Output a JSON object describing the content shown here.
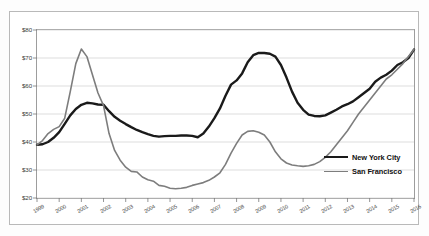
{
  "chart_data": {
    "type": "line",
    "title": "",
    "xlabel": "",
    "ylabel": "",
    "xlim": [
      1999,
      2016
    ],
    "ylim": [
      20,
      80
    ],
    "grid": true,
    "legend_position": "right-inside",
    "y_ticks": [
      "$20",
      "$30",
      "$40",
      "$50",
      "$60",
      "$70",
      "$80"
    ],
    "y_tick_values": [
      20,
      30,
      40,
      50,
      60,
      70,
      80
    ],
    "x_ticks": [
      "1999",
      "2000",
      "2001",
      "2002",
      "2003",
      "2004",
      "2005",
      "2006",
      "2007",
      "2008",
      "2009",
      "2010",
      "2011",
      "2012",
      "2013",
      "2014",
      "2015",
      "2016"
    ],
    "x_tick_values": [
      1999,
      2000,
      2001,
      2002,
      2003,
      2004,
      2005,
      2006,
      2007,
      2008,
      2009,
      2010,
      2011,
      2012,
      2013,
      2014,
      2015,
      2016
    ],
    "series": [
      {
        "name": "New York City",
        "color": "#1a1a1a",
        "width": 2.4,
        "x": [
          1999,
          1999.25,
          1999.5,
          1999.75,
          2000,
          2000.25,
          2000.5,
          2000.75,
          2001,
          2001.25,
          2001.5,
          2001.75,
          2002,
          2002.25,
          2002.5,
          2002.75,
          2003,
          2003.25,
          2003.5,
          2003.75,
          2004,
          2004.25,
          2004.5,
          2004.75,
          2005,
          2005.25,
          2005.5,
          2005.75,
          2006,
          2006.25,
          2006.5,
          2006.75,
          2007,
          2007.25,
          2007.5,
          2007.75,
          2008,
          2008.25,
          2008.5,
          2008.75,
          2009,
          2009.25,
          2009.5,
          2009.75,
          2010,
          2010.25,
          2010.5,
          2010.75,
          2011,
          2011.25,
          2011.5,
          2011.75,
          2012,
          2012.25,
          2012.5,
          2012.75,
          2013,
          2013.25,
          2013.5,
          2013.75,
          2014,
          2014.25,
          2014.5,
          2014.75,
          2015,
          2015.25,
          2015.5,
          2015.75,
          2016
        ],
        "values": [
          39.0,
          39.2,
          40.0,
          41.5,
          43.5,
          46.5,
          49.5,
          51.8,
          53.3,
          54.0,
          53.8,
          53.4,
          53.3,
          51.0,
          49.0,
          47.6,
          46.4,
          45.3,
          44.3,
          43.5,
          42.8,
          42.2,
          41.9,
          42.1,
          42.2,
          42.2,
          42.3,
          42.3,
          42.2,
          41.7,
          43.0,
          45.5,
          48.5,
          52.0,
          56.5,
          60.5,
          62.0,
          64.5,
          68.5,
          71.0,
          71.8,
          71.8,
          71.5,
          70.5,
          67.5,
          63.0,
          58.0,
          54.0,
          51.5,
          49.8,
          49.3,
          49.2,
          49.5,
          50.5,
          51.5,
          52.7,
          53.5,
          54.5,
          56.0,
          57.5,
          59.0,
          61.5,
          63.0,
          64.0,
          65.5,
          67.5,
          68.5,
          70.0,
          73.0
        ]
      },
      {
        "name": "San Francisco",
        "color": "#7d7d7d",
        "width": 1.6,
        "x": [
          1999,
          1999.25,
          1999.5,
          1999.75,
          2000,
          2000.25,
          2000.5,
          2000.75,
          2001,
          2001.25,
          2001.5,
          2001.75,
          2002,
          2002.25,
          2002.5,
          2002.75,
          2003,
          2003.25,
          2003.5,
          2003.75,
          2004,
          2004.25,
          2004.5,
          2004.75,
          2005,
          2005.25,
          2005.5,
          2005.75,
          2006,
          2006.25,
          2006.5,
          2006.75,
          2007,
          2007.25,
          2007.5,
          2007.75,
          2008,
          2008.25,
          2008.5,
          2008.75,
          2009,
          2009.25,
          2009.5,
          2009.75,
          2010,
          2010.25,
          2010.5,
          2010.75,
          2011,
          2011.25,
          2011.5,
          2011.75,
          2012,
          2012.25,
          2012.5,
          2012.75,
          2013,
          2013.25,
          2013.5,
          2013.75,
          2014,
          2014.25,
          2014.5,
          2014.75,
          2015,
          2015.25,
          2015.5,
          2015.75,
          2016
        ],
        "values": [
          39.0,
          40.5,
          43.0,
          44.5,
          45.5,
          48.5,
          58.0,
          68.0,
          73.2,
          70.5,
          64.0,
          57.5,
          53.0,
          43.0,
          37.0,
          33.5,
          31.0,
          29.5,
          29.3,
          27.5,
          26.5,
          26.0,
          24.5,
          24.2,
          23.5,
          23.3,
          23.5,
          23.8,
          24.5,
          25.0,
          25.5,
          26.3,
          27.5,
          29.0,
          32.0,
          36.0,
          39.5,
          42.5,
          43.8,
          44.0,
          43.5,
          42.5,
          40.0,
          36.5,
          34.0,
          32.5,
          31.8,
          31.5,
          31.3,
          31.5,
          32.0,
          33.0,
          34.5,
          36.5,
          39.0,
          41.5,
          44.0,
          47.0,
          50.0,
          52.5,
          55.0,
          57.5,
          60.0,
          62.5,
          64.0,
          66.0,
          68.0,
          70.5,
          73.0
        ]
      }
    ]
  },
  "legend": {
    "items": [
      {
        "label": "New York City"
      },
      {
        "label": "San Francisco"
      }
    ]
  }
}
